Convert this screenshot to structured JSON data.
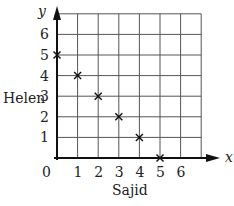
{
  "chart_data": {
    "type": "scatter",
    "title": "",
    "xlabel": "Sajid",
    "ylabel": "Helen",
    "x_axis_symbol": "x",
    "y_axis_symbol": "y",
    "x_ticks": [
      "0",
      "1",
      "2",
      "3",
      "4",
      "5",
      "6"
    ],
    "y_ticks": [
      "1",
      "2",
      "3",
      "4",
      "5",
      "6"
    ],
    "xlim": [
      0,
      7
    ],
    "ylim": [
      0,
      7
    ],
    "grid": true,
    "marker": "x",
    "points": [
      {
        "x": 0,
        "y": 5
      },
      {
        "x": 1,
        "y": 4
      },
      {
        "x": 2,
        "y": 3
      },
      {
        "x": 3,
        "y": 2
      },
      {
        "x": 4,
        "y": 1
      },
      {
        "x": 5,
        "y": 0
      }
    ]
  }
}
